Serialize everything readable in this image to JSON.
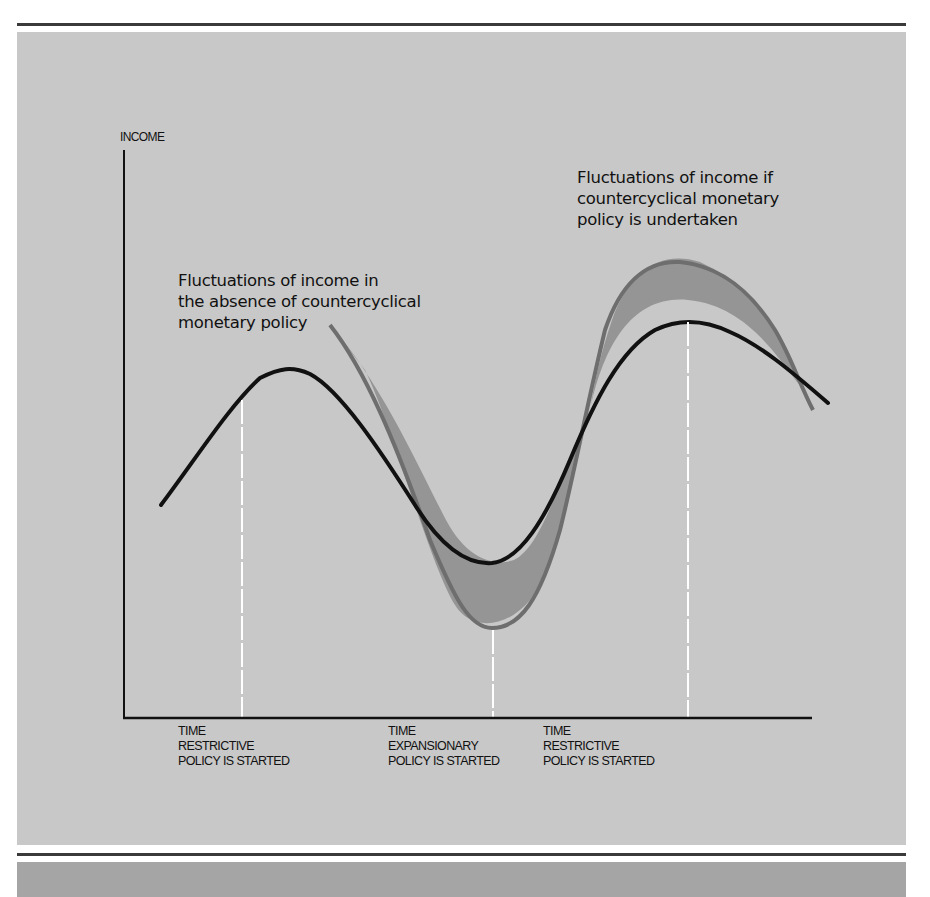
{
  "figure": {
    "y_axis_label": "INCOME",
    "annotations": {
      "without_policy": "Fluctuations of income in\nthe absence of countercyclical\nmonetary policy",
      "with_policy": "Fluctuations of income if\ncountercyclical monetary\npolicy is undertaken"
    },
    "time_markers": [
      {
        "label": "TIME\nRESTRICTIVE\nPOLICY IS STARTED"
      },
      {
        "label": "TIME\nEXPANSIONARY\nPOLICY IS STARTED"
      },
      {
        "label": "TIME\nRESTRICTIVE\nPOLICY IS STARTED"
      }
    ],
    "colors": {
      "panel": "#c8c8c8",
      "with_policy_curve": "#111111",
      "without_policy_curve": "#6e6e6e",
      "shaded_difference": "#8f8f8f",
      "marker_lines": "#ffffff",
      "bottom_band": "#a5a5a5"
    }
  }
}
